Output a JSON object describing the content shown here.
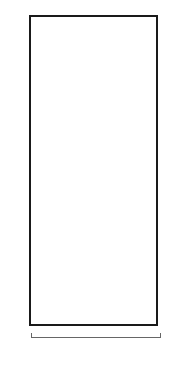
{
  "chart_data": {
    "type": "heatmap",
    "columns": 10,
    "rows": 24,
    "colors": {
      "G": "#b5b5b5",
      "W": "#ffffff"
    },
    "row_order": "top-to-bottom, row 24 first",
    "grid": {
      "24": "WGWGWGWGWG",
      "23": "GWGWWGGWGW",
      "22": "WGWWWGGGWG",
      "21": "GWWWWGGGGW",
      "20": "WWWWWGGGGG",
      "19": "WWWWWGGGGG",
      "18": "WWWWWGGGGG",
      "17": "WWWWWGGGGG",
      "16": "WWWWGWGGGG",
      "15": "WWWGWGWGGG",
      "14": "WWGWGWGWGG",
      "13": "WGWGWGWGWG",
      "12": "GWGWGWGWGW",
      "11": "GGWGWGWGWW",
      "10": "GGGWGWGWWW",
      "9": "GGGGWGWWWW",
      "8": "GGGGGWWWWW",
      "7": "GGGGGWWWWW",
      "6": "GGGGGWWWWW",
      "5": "GGGGGWWWWW",
      "4": "WGGGGWWWWG",
      "3": "GWGGGWWWGW",
      "2": "WGWGGWWGWG",
      "1": "GWGWGWGWGW"
    },
    "left_labels": [
      "24",
      "22",
      "20",
      "18",
      "16",
      "14",
      "12",
      "10",
      "8",
      "6",
      "4",
      "2"
    ],
    "right_labels": [
      "23",
      "21",
      "19",
      "17",
      "15",
      "13",
      "11",
      "9",
      "7",
      "5",
      "3",
      "1"
    ],
    "xlabel": "REPEAT"
  },
  "labels": {
    "repeat": "REPEAT"
  }
}
